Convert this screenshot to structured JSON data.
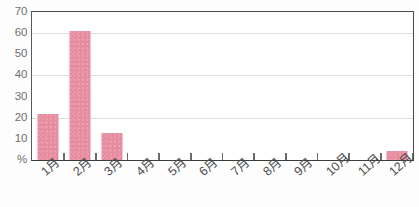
{
  "chart_data": {
    "type": "bar",
    "title": "",
    "xlabel": "",
    "ylabel": "%",
    "categories": [
      "1月",
      "2月",
      "3月",
      "4月",
      "5月",
      "6月",
      "7月",
      "8月",
      "9月",
      "10月",
      "11月",
      "12月"
    ],
    "values": [
      22,
      61,
      13,
      0,
      0,
      0,
      0,
      0,
      0,
      0,
      0,
      4.5
    ],
    "ylim": [
      0,
      70
    ],
    "ytick_values": [
      0,
      10,
      20,
      30,
      40,
      50,
      60,
      70
    ],
    "ytick_labels": [
      "%",
      "10",
      "20",
      "30",
      "40",
      "50",
      "60",
      "70"
    ],
    "gridline_values": [
      20,
      40,
      60
    ],
    "tickmark_values": [
      10,
      30,
      50,
      70
    ],
    "grid": true,
    "legend": false,
    "legend_position": "none",
    "series": [
      {
        "name": "月別割合",
        "values": [
          22,
          61,
          13,
          0,
          0,
          0,
          0,
          0,
          0,
          0,
          0,
          4.5
        ]
      }
    ]
  },
  "style": {
    "bar_color": "#e78c9e",
    "grid_color": "#dedede",
    "axis_color": "#4a4a4a",
    "label_color": "#6f6f6f",
    "tick_label_color": "#4d4d4d",
    "background": "#ffffff"
  }
}
